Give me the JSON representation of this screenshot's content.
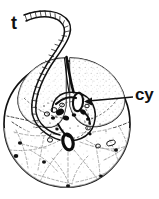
{
  "figure": {
    "kind": "scientific-line-drawing",
    "background_color": "#ffffff",
    "ink_color": "#111111",
    "width": 159,
    "height": 199,
    "labels": [
      {
        "id": "t",
        "text": "t",
        "meaning": "flagellum (tail)",
        "x": 11,
        "y": 14,
        "font_size": 18,
        "bold": true
      },
      {
        "id": "cy",
        "text": "cy",
        "meaning": "cytostome",
        "x": 135,
        "y": 86,
        "font_size": 17,
        "bold": true
      }
    ],
    "leader_line": {
      "name": "cy-arrow",
      "from_x": 133,
      "from_y": 97,
      "to_x": 84,
      "to_y": 101,
      "arrowhead": "at-target"
    },
    "cell_body": {
      "center_x": 67,
      "center_y": 124,
      "radius": 64,
      "outline_width": 1.6
    },
    "upper_lobes": {
      "count": 2,
      "shading": "stipple",
      "groove": "dark vertical median line"
    },
    "cytostome_oval": {
      "center_x": 78,
      "center_y": 102,
      "rx": 5,
      "ry": 9
    },
    "nucleus_oval": {
      "center_x": 68,
      "center_y": 142,
      "rx": 5,
      "ry": 8
    },
    "lower_region": {
      "pattern": "radiating dashed reticulum",
      "granules": 9
    }
  }
}
